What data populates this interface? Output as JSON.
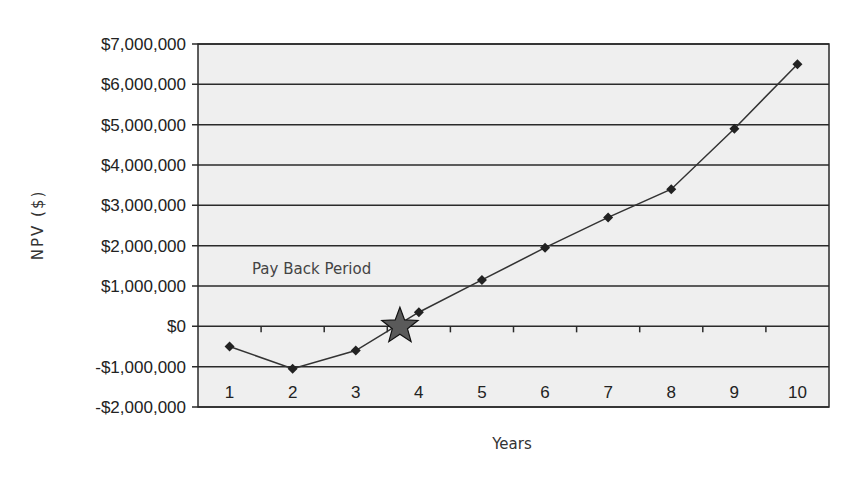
{
  "chart_data": {
    "type": "line",
    "title": "",
    "xlabel": "Years",
    "ylabel": "NPV ($)",
    "categories": [
      "1",
      "2",
      "3",
      "4",
      "5",
      "6",
      "7",
      "8",
      "9",
      "10"
    ],
    "series": [
      {
        "name": "NPV",
        "values": [
          -500000,
          -1050000,
          -600000,
          350000,
          1150000,
          1950000,
          2700000,
          3400000,
          4900000,
          6500000
        ],
        "marker": "diamond",
        "color": "#222222"
      }
    ],
    "ylim": [
      -2000000,
      7000000
    ],
    "ytick_step": 1000000,
    "ytick_labels": [
      "$7,000,000",
      "$6,000,000",
      "$5,000,000",
      "$4,000,000",
      "$3,000,000",
      "$2,000,000",
      "$1,000,000",
      "$0",
      "-$1,000,000",
      "-$2,000,000"
    ],
    "grid": true,
    "legend": null,
    "annotations": [
      {
        "text": "Pay Back Period",
        "marker": "star",
        "x_year": 3.7,
        "y": 0
      }
    ]
  },
  "colors": {
    "plot_background": "#efefef",
    "grid": "#2a2a2a",
    "line": "#333333",
    "star_fill": "#5a5a5a"
  }
}
